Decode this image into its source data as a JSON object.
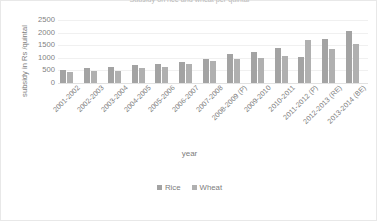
{
  "chart_data": {
    "type": "bar",
    "title": "Subsidy on rice and wheat per quintal",
    "xlabel": "year",
    "ylabel": "subsidy in Rs /quintal",
    "ylim": [
      0,
      2500
    ],
    "yticks": [
      2500,
      2000,
      1500,
      1000,
      500,
      0
    ],
    "grid": true,
    "legend_position": "bottom",
    "categories": [
      "2001-2002",
      "2002-2003",
      "2003-2004",
      "2004-2005",
      "2005-2006",
      "2006-2007",
      "2007-2008",
      "2008-2009 (P)",
      "2009-2010",
      "2010-2011",
      "2011-2012 (P)",
      "2012-2013 (RE)",
      "2013-2014 (BE)"
    ],
    "series": [
      {
        "name": "Rice",
        "color": "#a3a3a3",
        "values": [
          510,
          580,
          650,
          720,
          770,
          820,
          965,
          1165,
          1245,
          1390,
          1020,
          1745,
          2045
        ]
      },
      {
        "name": "Wheat",
        "color": "#b0b0b0",
        "values": [
          420,
          460,
          490,
          590,
          620,
          760,
          880,
          950,
          1000,
          1060,
          1690,
          1350,
          1545
        ]
      }
    ]
  }
}
